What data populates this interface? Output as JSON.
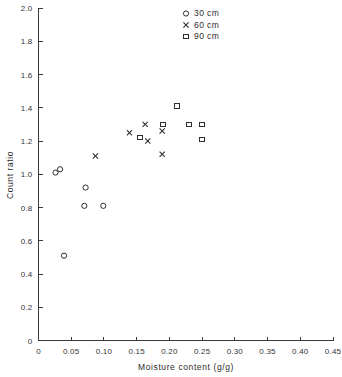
{
  "chart_data": {
    "type": "scatter",
    "title": "",
    "xlabel": "Moisture content (g/g)",
    "ylabel": "Count ratio",
    "xlim": [
      0,
      0.45
    ],
    "ylim": [
      0,
      2.0
    ],
    "grid": false,
    "legend_position": "top-right",
    "xticks": [
      0,
      0.05,
      0.1,
      0.15,
      0.2,
      0.25,
      0.3,
      0.35,
      0.4,
      0.45
    ],
    "xtick_labels": [
      "0",
      "0.05",
      "0.10",
      "0.15",
      "0.20",
      "0.25",
      "0.30",
      "0.35",
      "0.40",
      "0.45"
    ],
    "yticks": [
      0,
      0.2,
      0.4,
      0.6,
      0.8,
      1.0,
      1.2,
      1.4,
      1.6,
      1.8,
      2.0
    ],
    "ytick_labels": [
      "0",
      "0.2",
      "0.4",
      "0.6",
      "0.8",
      "1.0",
      "1.2",
      "1.4",
      "1.6",
      "1.8",
      "2.0"
    ],
    "series": [
      {
        "name": "30 cm",
        "marker": "circle",
        "points": [
          {
            "x": 0.026,
            "y": 1.01
          },
          {
            "x": 0.033,
            "y": 1.03
          },
          {
            "x": 0.039,
            "y": 0.51
          },
          {
            "x": 0.072,
            "y": 0.92
          },
          {
            "x": 0.07,
            "y": 0.81
          },
          {
            "x": 0.099,
            "y": 0.81
          }
        ]
      },
      {
        "name": "60 cm",
        "marker": "x",
        "points": [
          {
            "x": 0.087,
            "y": 1.11
          },
          {
            "x": 0.139,
            "y": 1.25
          },
          {
            "x": 0.163,
            "y": 1.3
          },
          {
            "x": 0.167,
            "y": 1.2
          },
          {
            "x": 0.189,
            "y": 1.26
          },
          {
            "x": 0.189,
            "y": 1.12
          }
        ]
      },
      {
        "name": "90 cm",
        "marker": "square",
        "points": [
          {
            "x": 0.155,
            "y": 1.22
          },
          {
            "x": 0.19,
            "y": 1.3
          },
          {
            "x": 0.212,
            "y": 1.41
          },
          {
            "x": 0.23,
            "y": 1.3
          },
          {
            "x": 0.25,
            "y": 1.3
          },
          {
            "x": 0.25,
            "y": 1.21
          }
        ]
      }
    ]
  },
  "legend": {
    "entries": [
      {
        "label": "30 cm",
        "marker": "circle"
      },
      {
        "label": "60 cm",
        "marker": "x"
      },
      {
        "label": "90 cm",
        "marker": "square"
      }
    ]
  },
  "colors": {
    "marker": "#2e2e2e",
    "axis": "#3a3a3a",
    "text": "#2b2b2b",
    "background": "#ffffff"
  }
}
